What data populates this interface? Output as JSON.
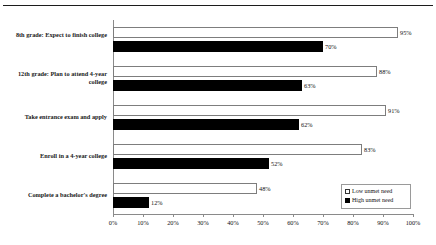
{
  "chart_data": {
    "type": "bar",
    "orientation": "horizontal",
    "grouped": true,
    "title": "",
    "subtitle": "",
    "xlabel": "",
    "ylabel": "",
    "xlim": [
      0,
      100
    ],
    "xtick_step": 10,
    "grid": false,
    "value_label_suffix": "%",
    "legend_position": "inside-bottom-right",
    "xtick_labels": [
      "0%",
      "10%",
      "20%",
      "30%",
      "40%",
      "50%",
      "60%",
      "70%",
      "80%",
      "90%",
      "100%"
    ],
    "categories": [
      "8th grade: Expect to finish college",
      "12th grade: Plan to attend 4-year college",
      "Take entrance exam and apply",
      "Enroll in a 4-year college",
      "Complete a bachelor's degree"
    ],
    "series": [
      {
        "name": "Low unmet need",
        "color": "#ffffff",
        "border_color": "#7d7d7d",
        "values": [
          95,
          88,
          91,
          83,
          48
        ],
        "labels": [
          "95%",
          "88%",
          "91%",
          "83%",
          "48%"
        ]
      },
      {
        "name": "High unmet need",
        "color": "#000000",
        "border_color": "#000000",
        "values": [
          70,
          63,
          62,
          52,
          12
        ],
        "labels": [
          "70%",
          "63%",
          "62%",
          "52%",
          "12%"
        ]
      }
    ],
    "legend": [
      {
        "label": "Low unmet need",
        "swatch": "open-square"
      },
      {
        "label": "High unmet need",
        "swatch": "filled-square"
      }
    ]
  }
}
